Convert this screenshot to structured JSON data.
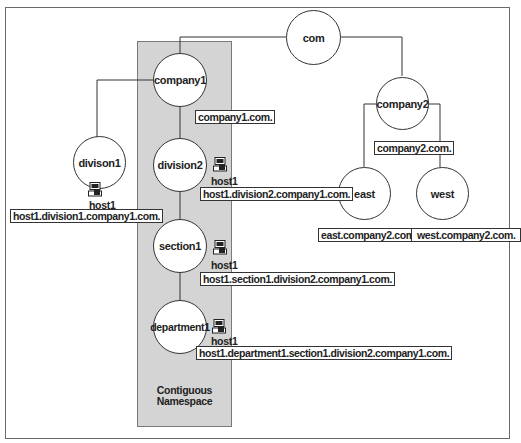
{
  "diagram": {
    "namespace_label": "Contiguous\nNamespace",
    "namespace_label_line1": "Contiguous",
    "namespace_label_line2": "Namespace",
    "nodes": {
      "com": "com",
      "company1": "company1",
      "company2": "company2",
      "division1": "divison1",
      "division2": "division2",
      "section1": "section1",
      "department1": "department1",
      "east": "east",
      "west": "west"
    },
    "fqdn_labels": {
      "company1": "company1.com.",
      "company2": "company2.com.",
      "east": "east.company2.com.",
      "west": "west.company2.com.",
      "division1_host": "host1.division1.company1.com.",
      "division2_host": "host1.division2.company1.com.",
      "section1_host": "host1.section1.division2.company1.com.",
      "department1_host": "host1.department1.section1.division2.company1.com."
    },
    "hosts": {
      "division1": "host1",
      "division2": "host1",
      "section1": "host1",
      "department1": "host1"
    },
    "icons": {
      "host": "computer-icon"
    },
    "colors": {
      "namespace_fill": "#d4d4d4",
      "line": "#333333",
      "background": "#ffffff"
    }
  }
}
